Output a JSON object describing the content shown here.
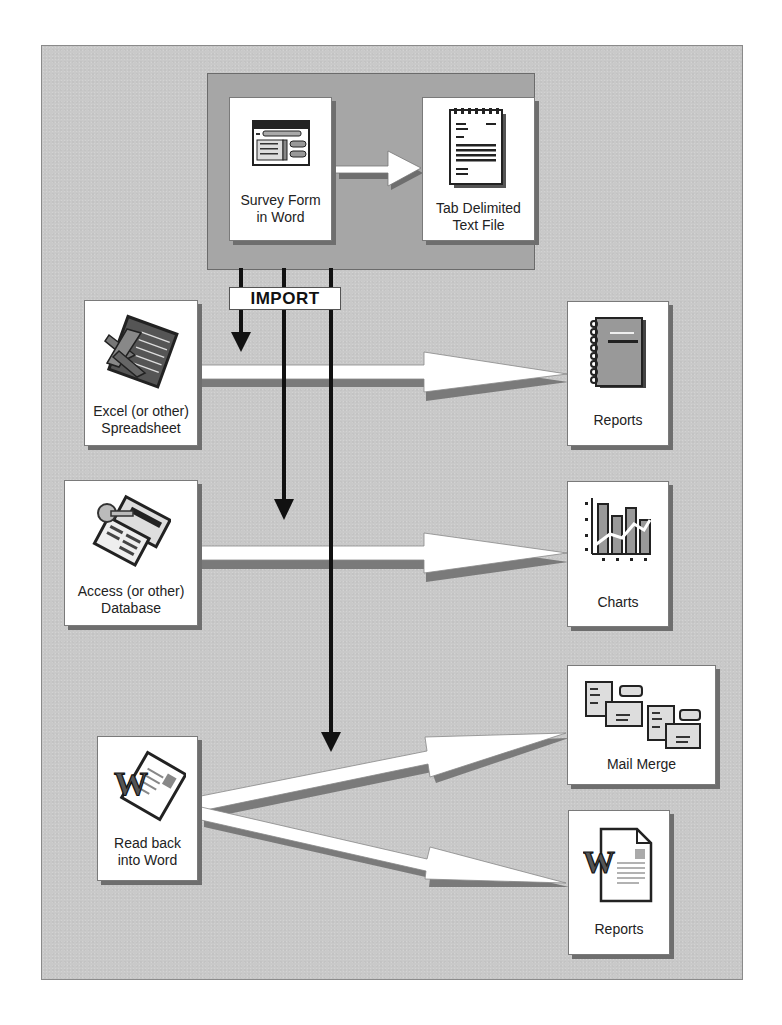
{
  "diagram": {
    "source_group": {
      "survey_form": {
        "label_line1": "Survey Form",
        "label_line2": "in Word",
        "icon": "form-window-icon"
      },
      "text_file": {
        "label_line1": "Tab Delimited",
        "label_line2": "Text File",
        "icon": "notepad-icon"
      }
    },
    "import_label": "IMPORT",
    "targets": {
      "excel": {
        "label_line1": "Excel (or other)",
        "label_line2": "Spreadsheet",
        "icon": "excel-icon"
      },
      "access": {
        "label_line1": "Access (or other)",
        "label_line2": "Database",
        "icon": "access-icon"
      },
      "word": {
        "label_line1": "Read back",
        "label_line2": "into Word",
        "icon": "word-icon"
      }
    },
    "outputs": {
      "reports_1": {
        "label": "Reports",
        "icon": "notebook-icon"
      },
      "charts": {
        "label": "Charts",
        "icon": "chart-icon"
      },
      "mail_merge": {
        "label": "Mail Merge",
        "icon": "envelopes-icon"
      },
      "reports_2": {
        "label": "Reports",
        "icon": "word-document-icon"
      }
    },
    "connections": [
      {
        "from": "survey_form",
        "to": "text_file"
      },
      {
        "from": "text_file",
        "to": "excel",
        "via": "IMPORT"
      },
      {
        "from": "text_file",
        "to": "access",
        "via": "IMPORT"
      },
      {
        "from": "text_file",
        "to": "word",
        "via": "IMPORT"
      },
      {
        "from": "excel",
        "to": "reports_1"
      },
      {
        "from": "access",
        "to": "charts"
      },
      {
        "from": "word",
        "to": "mail_merge"
      },
      {
        "from": "word",
        "to": "reports_2"
      }
    ],
    "colors": {
      "background": "#c9c9c9",
      "source_box": "#a6a6a6",
      "card": "#ffffff",
      "arrow_line": "#111111",
      "shadow": "#6e6e6e"
    }
  }
}
